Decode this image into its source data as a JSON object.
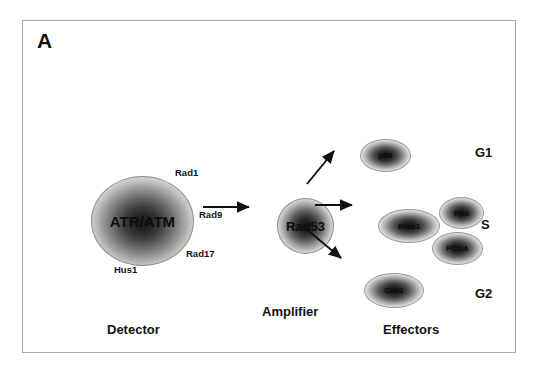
{
  "figure": {
    "panel_letter": "A",
    "border_color": "#aaaaac",
    "background": "#ffffff"
  },
  "detector": {
    "section_caption": "Detector",
    "node_label": "ATR/ATM",
    "satellite_labels": [
      {
        "name": "rad1",
        "text": "Rad1"
      },
      {
        "name": "rad9",
        "text": "Rad9"
      },
      {
        "name": "rad17",
        "text": "Rad17"
      },
      {
        "name": "hus1",
        "text": "Hus1"
      }
    ]
  },
  "amplifier": {
    "section_caption": "Amplifier",
    "node_label": "Rad53"
  },
  "effectors": {
    "section_caption": "Effectors",
    "nodes": [
      {
        "name": "p53",
        "label": "p53"
      },
      {
        "name": "brca1",
        "label": "Brca1"
      },
      {
        "name": "rpa",
        "label": "Rpa"
      },
      {
        "name": "pcna",
        "label": "PCNA"
      },
      {
        "name": "chk1",
        "label": "Chk1"
      }
    ]
  },
  "cell_cycle_phases": [
    {
      "name": "g1",
      "label": "G1"
    },
    {
      "name": "s",
      "label": "S"
    },
    {
      "name": "g2",
      "label": "G2"
    }
  ],
  "arrows": [
    {
      "name": "detector-to-amplifier",
      "from": "ATR/ATM",
      "to": "Rad53"
    },
    {
      "name": "amplifier-to-p53",
      "from": "Rad53",
      "to": "p53"
    },
    {
      "name": "amplifier-to-brca1",
      "from": "Rad53",
      "to": "Brca1"
    },
    {
      "name": "amplifier-to-chk1",
      "from": "Rad53",
      "to": "Chk1"
    }
  ]
}
